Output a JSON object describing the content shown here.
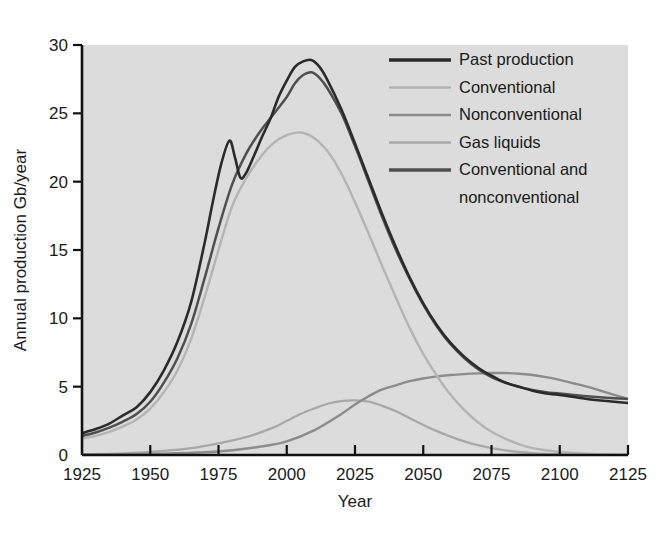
{
  "chart_data": {
    "type": "line",
    "title": "",
    "subtitle": "",
    "xlabel": "Year",
    "ylabel": "Annual production Gb/year",
    "xlim": [
      1925,
      2125
    ],
    "ylim": [
      0,
      30
    ],
    "xticks": [
      1925,
      1950,
      1975,
      2000,
      2025,
      2050,
      2075,
      2100,
      2125
    ],
    "yticks": [
      0,
      5,
      10,
      15,
      20,
      25,
      30
    ],
    "xtick_labels": [
      "1925",
      "1950",
      "1975",
      "2000",
      "2025",
      "2050",
      "2075",
      "2100",
      "2125"
    ],
    "ytick_labels": [
      "0",
      "5",
      "10",
      "15",
      "20",
      "25",
      "30"
    ],
    "grid": false,
    "legend_position": "top-right",
    "plot_background": "#dcdcdc",
    "series": [
      {
        "name": "Past production",
        "color": "#2b2b2b",
        "width": 2.6,
        "points": [
          [
            1925,
            1.6
          ],
          [
            1930,
            1.9
          ],
          [
            1935,
            2.3
          ],
          [
            1940,
            2.9
          ],
          [
            1945,
            3.5
          ],
          [
            1950,
            4.6
          ],
          [
            1955,
            6.2
          ],
          [
            1960,
            8.3
          ],
          [
            1965,
            11.2
          ],
          [
            1970,
            15.6
          ],
          [
            1973,
            18.6
          ],
          [
            1976,
            21.3
          ],
          [
            1979,
            23.0
          ],
          [
            1981,
            21.8
          ],
          [
            1983,
            20.3
          ],
          [
            1985,
            20.6
          ],
          [
            1988,
            21.9
          ],
          [
            1991,
            23.3
          ],
          [
            1994,
            24.6
          ],
          [
            1997,
            26.2
          ],
          [
            2000,
            27.4
          ],
          [
            2003,
            28.4
          ],
          [
            2006,
            28.8
          ],
          [
            2009,
            28.9
          ],
          [
            2012,
            28.4
          ],
          [
            2015,
            27.4
          ],
          [
            2020,
            25.3
          ],
          [
            2025,
            22.8
          ],
          [
            2030,
            20.2
          ],
          [
            2035,
            17.6
          ],
          [
            2040,
            15.2
          ],
          [
            2045,
            13.0
          ],
          [
            2050,
            11.1
          ],
          [
            2055,
            9.5
          ],
          [
            2060,
            8.2
          ],
          [
            2065,
            7.2
          ],
          [
            2070,
            6.4
          ],
          [
            2075,
            5.8
          ],
          [
            2080,
            5.3
          ],
          [
            2085,
            5.0
          ],
          [
            2090,
            4.7
          ],
          [
            2095,
            4.5
          ],
          [
            2100,
            4.4
          ],
          [
            2110,
            4.1
          ],
          [
            2120,
            3.9
          ],
          [
            2125,
            3.8
          ]
        ]
      },
      {
        "name": "Conventional",
        "color": "#b4b4b4",
        "width": 2.4,
        "points": [
          [
            1925,
            1.2
          ],
          [
            1930,
            1.4
          ],
          [
            1935,
            1.7
          ],
          [
            1940,
            2.1
          ],
          [
            1945,
            2.6
          ],
          [
            1950,
            3.4
          ],
          [
            1955,
            4.6
          ],
          [
            1960,
            6.2
          ],
          [
            1965,
            8.5
          ],
          [
            1970,
            11.6
          ],
          [
            1975,
            15.0
          ],
          [
            1980,
            18.2
          ],
          [
            1985,
            20.2
          ],
          [
            1990,
            21.7
          ],
          [
            1995,
            22.8
          ],
          [
            2000,
            23.4
          ],
          [
            2005,
            23.6
          ],
          [
            2010,
            23.2
          ],
          [
            2015,
            22.2
          ],
          [
            2020,
            20.6
          ],
          [
            2025,
            18.5
          ],
          [
            2030,
            16.2
          ],
          [
            2035,
            13.8
          ],
          [
            2040,
            11.5
          ],
          [
            2045,
            9.3
          ],
          [
            2050,
            7.4
          ],
          [
            2055,
            5.8
          ],
          [
            2060,
            4.4
          ],
          [
            2065,
            3.3
          ],
          [
            2070,
            2.4
          ],
          [
            2075,
            1.7
          ],
          [
            2080,
            1.2
          ],
          [
            2085,
            0.8
          ],
          [
            2090,
            0.5
          ],
          [
            2095,
            0.35
          ],
          [
            2100,
            0.22
          ],
          [
            2110,
            0.1
          ],
          [
            2120,
            0.04
          ],
          [
            2125,
            0.02
          ]
        ]
      },
      {
        "name": "Nonconventional",
        "color": "#8c8c8c",
        "width": 2.4,
        "points": [
          [
            1925,
            0.02
          ],
          [
            1940,
            0.05
          ],
          [
            1955,
            0.1
          ],
          [
            1970,
            0.2
          ],
          [
            1980,
            0.35
          ],
          [
            1990,
            0.6
          ],
          [
            2000,
            1.0
          ],
          [
            2010,
            1.8
          ],
          [
            2020,
            3.0
          ],
          [
            2025,
            3.7
          ],
          [
            2030,
            4.3
          ],
          [
            2035,
            4.8
          ],
          [
            2040,
            5.1
          ],
          [
            2045,
            5.4
          ],
          [
            2050,
            5.6
          ],
          [
            2055,
            5.75
          ],
          [
            2060,
            5.85
          ],
          [
            2065,
            5.92
          ],
          [
            2070,
            5.97
          ],
          [
            2075,
            6.0
          ],
          [
            2080,
            6.0
          ],
          [
            2085,
            5.95
          ],
          [
            2090,
            5.85
          ],
          [
            2095,
            5.7
          ],
          [
            2100,
            5.5
          ],
          [
            2105,
            5.25
          ],
          [
            2110,
            5.0
          ],
          [
            2115,
            4.7
          ],
          [
            2120,
            4.4
          ],
          [
            2125,
            4.1
          ]
        ]
      },
      {
        "name": "Gas liquids",
        "color": "#a8a8a8",
        "width": 2.3,
        "points": [
          [
            1925,
            0.05
          ],
          [
            1940,
            0.12
          ],
          [
            1955,
            0.3
          ],
          [
            1965,
            0.5
          ],
          [
            1975,
            0.85
          ],
          [
            1985,
            1.3
          ],
          [
            1995,
            2.0
          ],
          [
            2000,
            2.5
          ],
          [
            2005,
            3.0
          ],
          [
            2010,
            3.4
          ],
          [
            2015,
            3.75
          ],
          [
            2020,
            3.95
          ],
          [
            2025,
            4.0
          ],
          [
            2030,
            3.9
          ],
          [
            2035,
            3.6
          ],
          [
            2040,
            3.2
          ],
          [
            2045,
            2.7
          ],
          [
            2050,
            2.2
          ],
          [
            2055,
            1.75
          ],
          [
            2060,
            1.35
          ],
          [
            2065,
            1.0
          ],
          [
            2070,
            0.72
          ],
          [
            2075,
            0.5
          ],
          [
            2080,
            0.34
          ],
          [
            2085,
            0.22
          ],
          [
            2090,
            0.14
          ],
          [
            2095,
            0.08
          ],
          [
            2100,
            0.05
          ],
          [
            2110,
            0.02
          ],
          [
            2125,
            0.01
          ]
        ]
      },
      {
        "name": "Conventional and nonconventional",
        "color": "#4f4f4f",
        "width": 2.5,
        "points": [
          [
            1925,
            1.4
          ],
          [
            1930,
            1.65
          ],
          [
            1935,
            2.0
          ],
          [
            1940,
            2.45
          ],
          [
            1945,
            3.0
          ],
          [
            1950,
            3.9
          ],
          [
            1955,
            5.3
          ],
          [
            1960,
            7.1
          ],
          [
            1965,
            9.6
          ],
          [
            1970,
            13.0
          ],
          [
            1975,
            16.6
          ],
          [
            1980,
            19.8
          ],
          [
            1985,
            22.0
          ],
          [
            1990,
            23.6
          ],
          [
            1995,
            24.9
          ],
          [
            2000,
            26.2
          ],
          [
            2003,
            27.2
          ],
          [
            2006,
            27.8
          ],
          [
            2009,
            28.0
          ],
          [
            2012,
            27.6
          ],
          [
            2015,
            26.8
          ],
          [
            2020,
            25.0
          ],
          [
            2025,
            22.6
          ],
          [
            2030,
            20.0
          ],
          [
            2035,
            17.4
          ],
          [
            2040,
            15.0
          ],
          [
            2045,
            12.9
          ],
          [
            2050,
            11.0
          ],
          [
            2055,
            9.4
          ],
          [
            2060,
            8.1
          ],
          [
            2065,
            7.1
          ],
          [
            2070,
            6.3
          ],
          [
            2075,
            5.7
          ],
          [
            2080,
            5.3
          ],
          [
            2085,
            5.0
          ],
          [
            2090,
            4.75
          ],
          [
            2095,
            4.6
          ],
          [
            2100,
            4.5
          ],
          [
            2110,
            4.3
          ],
          [
            2120,
            4.15
          ],
          [
            2125,
            4.1
          ]
        ]
      }
    ]
  },
  "legend": {
    "entries": [
      {
        "label": "Past production",
        "color": "#2b2b2b"
      },
      {
        "label": "Conventional",
        "color": "#b4b4b4"
      },
      {
        "label": "Nonconventional",
        "color": "#8c8c8c"
      },
      {
        "label": "Gas liquids",
        "color": "#a8a8a8"
      },
      {
        "label": "Conventional and",
        "color": "#4f4f4f"
      },
      {
        "label": "nonconventional",
        "color": ""
      }
    ]
  }
}
